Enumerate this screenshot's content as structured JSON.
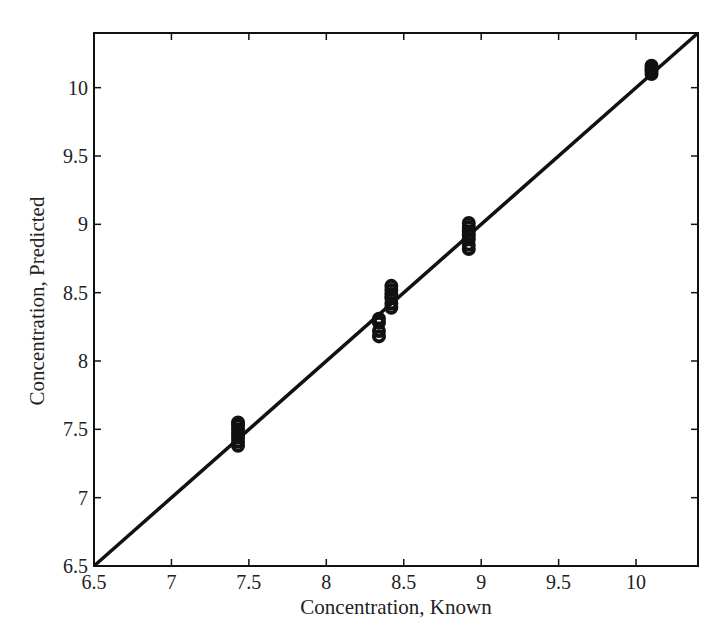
{
  "chart_data": {
    "type": "scatter",
    "title": "",
    "xlabel": "Concentration, Known",
    "ylabel": "Concentration, Predicted",
    "xlim": [
      6.5,
      10.4
    ],
    "ylim": [
      6.5,
      10.4
    ],
    "xticks": [
      6.5,
      7,
      7.5,
      8,
      8.5,
      9,
      9.5,
      10
    ],
    "xtick_labels": [
      "6.5",
      "7",
      "7.5",
      "8",
      "8.5",
      "9",
      "9.5",
      "10"
    ],
    "yticks": [
      6.5,
      7,
      7.5,
      8,
      8.5,
      9,
      9.5,
      10
    ],
    "ytick_labels": [
      "6.5",
      "7",
      "7.5",
      "8",
      "8.5",
      "9",
      "9.5",
      "10"
    ],
    "grid": false,
    "legend": null,
    "series": [
      {
        "name": "samples",
        "marker": "open-circle",
        "color": "#111111",
        "x": [
          7.43,
          7.43,
          7.43,
          7.43,
          7.43,
          7.43,
          7.43,
          8.34,
          8.34,
          8.34,
          8.34,
          8.42,
          8.42,
          8.42,
          8.42,
          8.42,
          8.42,
          8.92,
          8.92,
          8.92,
          8.92,
          8.92,
          8.92,
          8.92,
          10.1,
          10.1,
          10.1,
          10.1
        ],
        "y": [
          7.38,
          7.41,
          7.44,
          7.47,
          7.5,
          7.53,
          7.55,
          8.18,
          8.22,
          8.28,
          8.31,
          8.39,
          8.42,
          8.46,
          8.49,
          8.52,
          8.55,
          8.82,
          8.85,
          8.89,
          8.92,
          8.95,
          8.98,
          9.01,
          10.1,
          10.12,
          10.14,
          10.16
        ]
      },
      {
        "name": "identity line",
        "type": "line",
        "color": "#111111",
        "x": [
          6.5,
          10.4
        ],
        "y": [
          6.5,
          10.4
        ]
      }
    ]
  },
  "plot": {
    "frame": {
      "left": 94,
      "top": 33,
      "right": 698,
      "bottom": 566
    },
    "line_color": "#111111",
    "text_color": "#222222"
  }
}
